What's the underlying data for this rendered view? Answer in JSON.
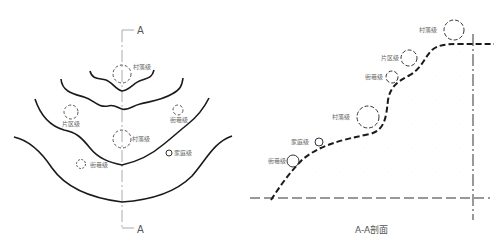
{
  "plan": {
    "section_marker_top": "A",
    "section_marker_bottom": "A",
    "labels": [
      {
        "id": "village-top",
        "text": "村落级"
      },
      {
        "id": "district-left",
        "text": "片区级"
      },
      {
        "id": "street-right",
        "text": "街巷级"
      },
      {
        "id": "village-center",
        "text": "村落级"
      },
      {
        "id": "family-right",
        "text": "家庭级"
      },
      {
        "id": "street-left",
        "text": "街巷级"
      }
    ]
  },
  "section": {
    "caption": "A-A剖面",
    "labels": [
      {
        "id": "village-top",
        "text": "村落级"
      },
      {
        "id": "district",
        "text": "片区级"
      },
      {
        "id": "street-upper",
        "text": "街巷级"
      },
      {
        "id": "village-mid",
        "text": "村落级"
      },
      {
        "id": "family",
        "text": "家庭级"
      },
      {
        "id": "street-lower",
        "text": "街巷级"
      }
    ]
  },
  "colors": {
    "line": "#1a1a1a",
    "axis": "#999999",
    "label": "#666666"
  }
}
